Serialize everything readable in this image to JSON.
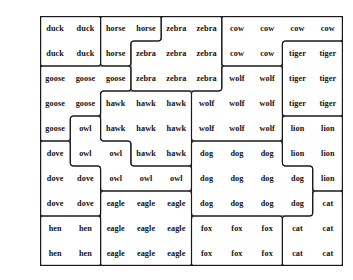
{
  "board": {
    "rows": 10,
    "cols": 10,
    "cell_width": 30.3,
    "cell_height": 25,
    "origin_x": 40,
    "origin_y": 16,
    "border_color": "#1a1a1a",
    "text_color": "#111111",
    "background": "#ffffff",
    "cells": [
      [
        "duck",
        "duck",
        "horse",
        "horse",
        "zebra",
        "zebra",
        "cow",
        "cow",
        "cow",
        "cow"
      ],
      [
        "duck",
        "duck",
        "horse",
        "zebra",
        "zebra",
        "zebra",
        "cow",
        "cow",
        "tiger",
        "tiger"
      ],
      [
        "goose",
        "goose",
        "goose",
        "zebra",
        "zebra",
        "zebra",
        "wolf",
        "wolf",
        "tiger",
        "tiger"
      ],
      [
        "goose",
        "goose",
        "hawk",
        "hawk",
        "hawk",
        "wolf",
        "wolf",
        "wolf",
        "tiger",
        "tiger"
      ],
      [
        "goose",
        "owl",
        "hawk",
        "hawk",
        "hawk",
        "wolf",
        "wolf",
        "wolf",
        "lion",
        "lion"
      ],
      [
        "dove",
        "owl",
        "owl",
        "hawk",
        "hawk",
        "dog",
        "dog",
        "dog",
        "lion",
        "lion"
      ],
      [
        "dove",
        "dove",
        "owl",
        "owl",
        "owl",
        "dog",
        "dog",
        "dog",
        "dog",
        "lion"
      ],
      [
        "dove",
        "dove",
        "eagle",
        "eagle",
        "eagle",
        "dog",
        "dog",
        "dog",
        "dog",
        "cat"
      ],
      [
        "hen",
        "hen",
        "eagle",
        "eagle",
        "eagle",
        "fox",
        "fox",
        "fox",
        "cat",
        "cat"
      ],
      [
        "hen",
        "hen",
        "eagle",
        "eagle",
        "eagle",
        "fox",
        "fox",
        "fox",
        "cat",
        "cat"
      ]
    ],
    "region_labels": [
      "duck",
      "horse",
      "zebra",
      "cow",
      "tiger",
      "goose",
      "hawk",
      "wolf",
      "owl",
      "lion",
      "dove",
      "dog",
      "eagle",
      "hen",
      "fox",
      "cat"
    ]
  }
}
